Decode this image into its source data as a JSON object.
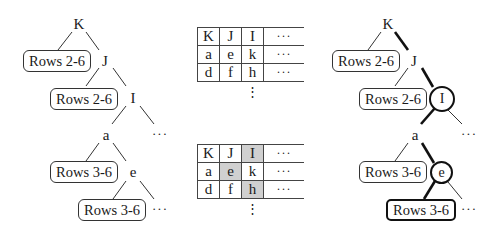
{
  "left_tree": {
    "nodes": {
      "root": "K",
      "n2": "J",
      "n3": "I",
      "n4": "a",
      "n5": "e"
    },
    "leaves": [
      "Rows 2-6",
      "Rows 2-6",
      "Rows 3-6",
      "Rows 3-6"
    ],
    "ellipsis": "···"
  },
  "tables": [
    {
      "rows": [
        [
          "K",
          "J",
          "I",
          "···"
        ],
        [
          "a",
          "e",
          "k",
          "···"
        ],
        [
          "d",
          "f",
          "h",
          "···"
        ]
      ],
      "highlighted": []
    },
    {
      "rows": [
        [
          "K",
          "J",
          "I",
          "···"
        ],
        [
          "a",
          "e",
          "k",
          "···"
        ],
        [
          "d",
          "f",
          "h",
          "···"
        ]
      ],
      "highlighted": [
        [
          0,
          2
        ],
        [
          1,
          1
        ],
        [
          2,
          2
        ]
      ]
    }
  ],
  "vertical_ellipsis": "⋮",
  "right_tree": {
    "nodes": {
      "root": "K",
      "n2": "J",
      "n3": "I",
      "n4": "a",
      "n5": "e"
    },
    "leaves": [
      "Rows 2-6",
      "Rows 2-6",
      "Rows 3-6",
      "Rows 3-6"
    ],
    "highlighted_nodes": [
      "I",
      "e"
    ],
    "highlighted_leaf": "Rows 3-6",
    "ellipsis": "···"
  },
  "colors": {
    "line": "#333333",
    "bold_line": "#111111",
    "highlight_cell": "#d0d0d0"
  }
}
